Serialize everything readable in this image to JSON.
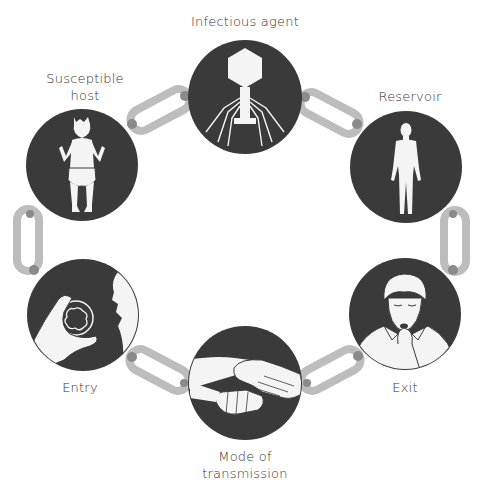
{
  "diagram": {
    "colors": {
      "circle_fill": "#3a3a3a",
      "figure_fill": "#f4f4f4",
      "link": "#bdbdbd",
      "link_joint": "#8a8a8a",
      "label_text": "#333333",
      "background": "#ffffff"
    },
    "nodes": [
      {
        "id": "infectious-agent",
        "label": "Infectious agent",
        "icon": "bacteriophage-icon",
        "cx": 245,
        "cy": 97,
        "r": 57
      },
      {
        "id": "reservoir",
        "label": "Reservoir",
        "icon": "human-body-icon",
        "cx": 406,
        "cy": 167,
        "r": 56
      },
      {
        "id": "exit",
        "label": "Exit",
        "icon": "coughing-boy-icon",
        "cx": 405,
        "cy": 314,
        "r": 56
      },
      {
        "id": "mode-of-transmission",
        "label_line1": "Mode of",
        "label_line2": "transmission",
        "icon": "handshake-icon",
        "cx": 245,
        "cy": 383,
        "r": 57
      },
      {
        "id": "entry",
        "label": "Entry",
        "icon": "hand-to-mouth-icon",
        "cx": 83,
        "cy": 315,
        "r": 56
      },
      {
        "id": "susceptible-host",
        "label_line1": "Susceptible",
        "label_line2": "host",
        "icon": "baby-icon",
        "cx": 82,
        "cy": 165,
        "r": 56
      }
    ],
    "links": [
      {
        "from": "infectious-agent",
        "to": "reservoir"
      },
      {
        "from": "reservoir",
        "to": "exit"
      },
      {
        "from": "exit",
        "to": "mode-of-transmission"
      },
      {
        "from": "mode-of-transmission",
        "to": "entry"
      },
      {
        "from": "entry",
        "to": "susceptible-host"
      },
      {
        "from": "susceptible-host",
        "to": "infectious-agent"
      }
    ]
  }
}
